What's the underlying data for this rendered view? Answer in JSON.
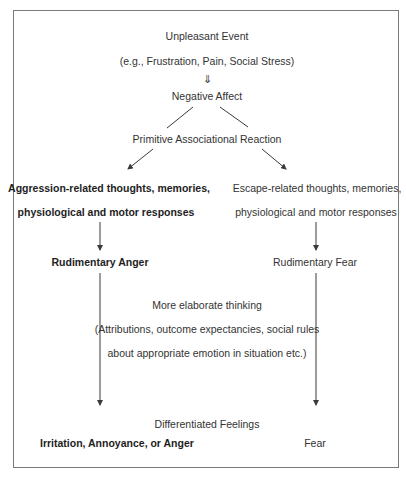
{
  "diagram": {
    "title_nodes": {
      "event": "Unpleasant Event",
      "event_examples": "(e.g., Frustration, Pain, Social Stress)",
      "down_arrow_glyph": "⇓",
      "negative_affect": "Negative Affect",
      "primitive_reaction": "Primitive Associational Reaction"
    },
    "left_branch": {
      "line1": "Aggression-related thoughts, memories,",
      "line2": "physiological and motor responses",
      "rudimentary": "Rudimentary Anger",
      "final": "Irritation, Annoyance, or Anger"
    },
    "right_branch": {
      "line1": "Escape-related thoughts, memories,",
      "line2": "physiological and motor responses",
      "rudimentary": "Rudimentary Fear",
      "final": "Fear"
    },
    "middle": {
      "thinking": "More elaborate thinking",
      "details_line1": "(Attributions, outcome expectancies, social rules",
      "details_line2": "about appropriate emotion in situation etc.)",
      "differentiated": "Differentiated Feelings"
    },
    "colors": {
      "line": "#3a3a3a",
      "frame": "#7a7a7a",
      "text": "#333333"
    }
  }
}
